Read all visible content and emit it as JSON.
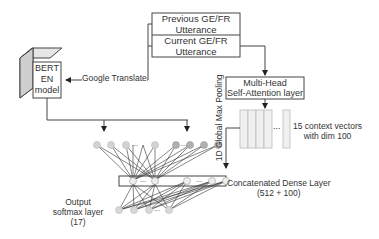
{
  "utterance_box": {
    "previous": [
      "Previous GE/FR",
      "Utterance"
    ],
    "current": [
      "Current GE/FR",
      "Utterance"
    ]
  },
  "bert": {
    "lines": [
      "BERT",
      "EN",
      "model"
    ]
  },
  "translate_label": "Google Translate",
  "attention": {
    "lines": [
      "Multi-Head",
      "Self-Attention layer"
    ]
  },
  "pooling_label": "1D Global Max Pooling",
  "context_vectors": {
    "lines": [
      "15 context vectors",
      "with dim 100"
    ],
    "ellipsis": "..."
  },
  "dense": {
    "lines": [
      "Concatenated Dense Layer",
      "(512 + 100)"
    ]
  },
  "output": {
    "lines": [
      "Output",
      "softmax layer",
      "(17)"
    ]
  },
  "ellipsis": "..."
}
